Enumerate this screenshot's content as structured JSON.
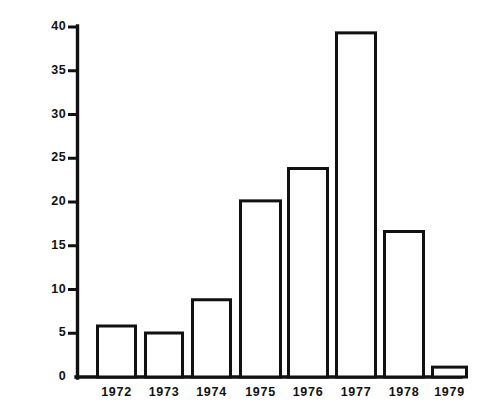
{
  "chart_data": {
    "type": "bar",
    "title": "",
    "subtitle": "",
    "xlabel": "",
    "ylabel": "Number of Wolf Reports",
    "categories": [
      "1972",
      "1973",
      "1974",
      "1975",
      "1976",
      "1977",
      "1978",
      "1979"
    ],
    "values": [
      6.0,
      5.2,
      9.0,
      20.3,
      24.0,
      39.5,
      16.8,
      1.3
    ],
    "ylim": [
      0,
      40
    ],
    "y_ticks": [
      0,
      5,
      10,
      15,
      20,
      25,
      30,
      35,
      40
    ],
    "y_tick_labels": [
      "0",
      "5",
      "10",
      "15",
      "20",
      "25",
      "30",
      "35",
      "40"
    ],
    "grid": false,
    "legend": null,
    "legend_position": "none",
    "annotations": [],
    "bar_style": {
      "fill": "#ffffff",
      "edge_color": "#111111",
      "edge_width": 3
    },
    "axis_color": "#111111",
    "background_color": "#ffffff"
  },
  "axes": {
    "y_title": "Number of Wolf Reports",
    "x_title": ""
  }
}
